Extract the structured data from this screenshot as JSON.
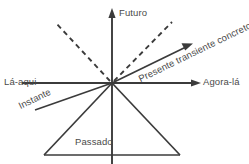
{
  "diagram": {
    "colors": {
      "background": "#ffffff",
      "stroke": "#3b3b3b",
      "text": "#4a4a4a"
    },
    "labels": {
      "futuro": "Futuro",
      "agora_la": "Agora-lá",
      "la_aqui": "Lá-aqui",
      "passado": "Passado",
      "instante": "Instante",
      "presente": "Presente transiente concreto"
    },
    "geometry": {
      "origin": {
        "x": 112,
        "y": 83
      },
      "vertical_axis": {
        "x": 112,
        "y_top": 10,
        "y_bottom": 164
      },
      "horizontal_axis": {
        "y": 83,
        "x_left": 22,
        "x_right": 200
      },
      "diagonal_arrow": {
        "x1": 112,
        "y1": 83,
        "x2": 192,
        "y2": 44
      },
      "dashed_left": {
        "x1": 112,
        "y1": 83,
        "x2": 55,
        "y2": 22
      },
      "dashed_right": {
        "x1": 112,
        "y1": 83,
        "x2": 172,
        "y2": 22
      },
      "ray_instante": {
        "x1": 112,
        "y1": 83,
        "x2": 35,
        "y2": 110
      },
      "triangle": {
        "apex": {
          "x": 112,
          "y": 83
        },
        "left": {
          "x": 44,
          "y": 155
        },
        "right": {
          "x": 180,
          "y": 155
        }
      }
    }
  }
}
